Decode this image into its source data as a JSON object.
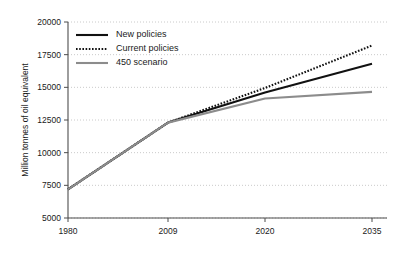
{
  "chart_data": {
    "type": "line",
    "title": "",
    "xlabel": "",
    "ylabel": "Million tonnes of oil equivalent",
    "x": [
      1980,
      2009,
      2020,
      2035
    ],
    "x_tick_labels": [
      "1980",
      "2009",
      "2020",
      "2035"
    ],
    "y_tick_labels": [
      "5000",
      "7500",
      "10000",
      "12500",
      "15000",
      "17500",
      "20000"
    ],
    "y_ticks": [
      5000,
      7500,
      10000,
      12500,
      15000,
      17500,
      20000
    ],
    "xlim": [
      1980,
      2035
    ],
    "ylim": [
      5000,
      20000
    ],
    "grid": "horizontal-dotted",
    "legend_position": "top-left-inside",
    "series": [
      {
        "name": "New policies",
        "style": "solid",
        "color": "#111111",
        "width": 2.1,
        "values": [
          7200,
          12300,
          14600,
          16800
        ]
      },
      {
        "name": "Current policies",
        "style": "dotted",
        "color": "#111111",
        "width": 2.1,
        "values": [
          7200,
          12300,
          14950,
          18200
        ]
      },
      {
        "name": "450 scenario",
        "style": "solid",
        "color": "#8c8c8c",
        "width": 2.1,
        "values": [
          7200,
          12300,
          14150,
          14650
        ]
      }
    ]
  },
  "legend": {
    "items": [
      {
        "label": "New policies"
      },
      {
        "label": "Current policies"
      },
      {
        "label": "450 scenario"
      }
    ]
  },
  "axes": {
    "y_title": "Million tonnes of oil equivalent"
  }
}
